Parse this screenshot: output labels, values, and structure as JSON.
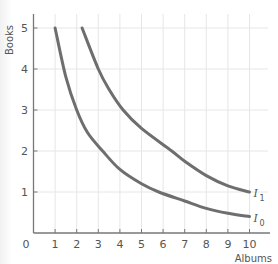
{
  "chart_data": {
    "type": "line",
    "title": "",
    "xlabel": "Albums",
    "ylabel": "Books",
    "xlim": [
      0,
      10
    ],
    "ylim": [
      0,
      5.4
    ],
    "x_ticks": [
      "0",
      "1",
      "2",
      "3",
      "4",
      "5",
      "6",
      "7",
      "8",
      "9",
      "10"
    ],
    "y_ticks": [
      "1",
      "2",
      "3",
      "4",
      "5"
    ],
    "grid": true,
    "legend": "none (curves labeled inline at right end)",
    "series": [
      {
        "name": "I0",
        "label_main": "I",
        "label_sub": "0",
        "x": [
          1.0,
          1.5,
          2.0,
          2.5,
          3.2,
          4.0,
          5.0,
          5.8,
          7.0,
          8.0,
          9.0,
          10.0
        ],
        "y": [
          5.0,
          3.8,
          3.0,
          2.45,
          2.0,
          1.55,
          1.2,
          1.0,
          0.78,
          0.6,
          0.48,
          0.4
        ]
      },
      {
        "name": "I1",
        "label_main": "I",
        "label_sub": "1",
        "x": [
          2.25,
          3.0,
          3.5,
          4.15,
          5.0,
          6.4,
          7.0,
          8.0,
          9.0,
          10.0
        ],
        "y": [
          5.0,
          4.0,
          3.5,
          3.0,
          2.55,
          2.0,
          1.75,
          1.4,
          1.15,
          1.0
        ]
      }
    ],
    "colors": {
      "curve": "#6e6e6e",
      "axis": "#777777",
      "grid": "#e6e6e6",
      "text": "#555555"
    }
  }
}
